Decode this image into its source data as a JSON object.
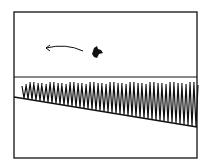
{
  "sketch": {
    "description": "Hand-drawn sketch: framed scene with a dark flying creature moving left (indicated by arrow) above a row of grass/corn stalks on a sloped field",
    "colors": {
      "ink": "#111111",
      "paper": "#ffffff"
    },
    "elements": [
      "frame",
      "motion-arrow",
      "flying-creature",
      "horizon-line",
      "grass-row",
      "ground-slope-line"
    ]
  }
}
